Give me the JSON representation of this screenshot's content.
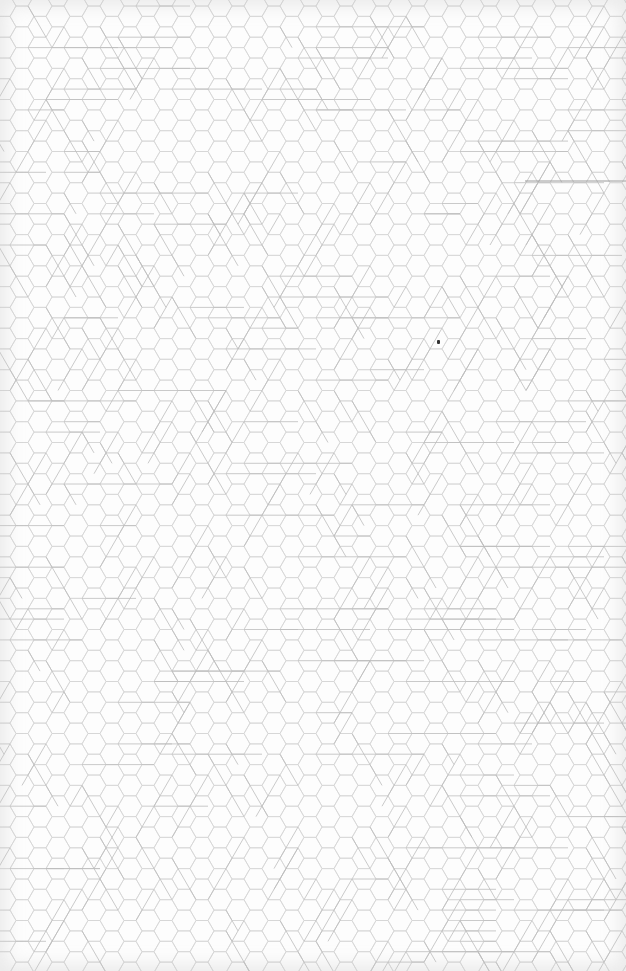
{
  "image": {
    "width": 626,
    "height": 971,
    "description": "Hexagonal grid pattern paper with overlaid triangular lattice line segments"
  },
  "pattern": {
    "type": "flat-top-hexagon-grid",
    "hex_side": 12,
    "background_color": "#fdfdfd",
    "hex_line_color": "#d6d6d6",
    "overlay_line_color": "#bdbdbd",
    "accent_line_color": "#9a9a9a"
  },
  "accent_lines": [
    {
      "x1": 525,
      "y1": 181,
      "x2": 626,
      "y2": 181
    }
  ],
  "marker": {
    "x": 437,
    "y": 340
  }
}
